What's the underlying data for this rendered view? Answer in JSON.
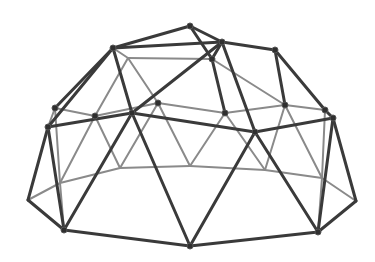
{
  "image": {
    "subject": "geodesic dome climber",
    "background": "#ffffff",
    "strut_color_front": "#3a3a3a",
    "strut_color_back": "#8a8a8a",
    "hub_color": "#2f2f2f"
  },
  "nodes": {
    "T0": [
      190,
      26
    ],
    "TL": [
      113,
      48
    ],
    "TR": [
      222,
      42
    ],
    "TR2": [
      275,
      50
    ],
    "TM": [
      212,
      59
    ],
    "TL2": [
      128,
      58
    ],
    "ML": [
      55,
      108
    ],
    "ML2": [
      48,
      127
    ],
    "M1": [
      95,
      116
    ],
    "M2": [
      132,
      113
    ],
    "M3": [
      158,
      103
    ],
    "M4": [
      225,
      113
    ],
    "M5": [
      255,
      132
    ],
    "M6": [
      285,
      105
    ],
    "MR": [
      325,
      110
    ],
    "MR2": [
      333,
      118
    ],
    "LB1": [
      120,
      168
    ],
    "LB2": [
      190,
      166
    ],
    "LB3": [
      265,
      170
    ],
    "LBL": [
      60,
      183
    ],
    "LBR": [
      322,
      178
    ],
    "BL": [
      28,
      200
    ],
    "BL2": [
      64,
      230
    ],
    "BC": [
      190,
      246
    ],
    "BR": [
      318,
      232
    ],
    "BRR": [
      356,
      201
    ]
  },
  "front_struts": [
    [
      "T0",
      "TL"
    ],
    [
      "T0",
      "TR"
    ],
    [
      "TL",
      "TR"
    ],
    [
      "TR",
      "TR2"
    ],
    [
      "TL",
      "ML"
    ],
    [
      "TL",
      "ML2"
    ],
    [
      "TR",
      "M2"
    ],
    [
      "TR",
      "TM"
    ],
    [
      "TM",
      "M4"
    ],
    [
      "TR2",
      "MR"
    ],
    [
      "TR2",
      "M6"
    ],
    [
      "TL",
      "M2"
    ],
    [
      "ML2",
      "M2"
    ],
    [
      "M2",
      "M5"
    ],
    [
      "M5",
      "MR2"
    ],
    [
      "MR",
      "MR2"
    ],
    [
      "ML2",
      "BL"
    ],
    [
      "ML2",
      "BL2"
    ],
    [
      "M2",
      "BL2"
    ],
    [
      "M2",
      "BC"
    ],
    [
      "M5",
      "BC"
    ],
    [
      "M5",
      "BR"
    ],
    [
      "MR2",
      "BR"
    ],
    [
      "MR2",
      "BRR"
    ],
    [
      "BL",
      "BL2"
    ],
    [
      "BL2",
      "BC"
    ],
    [
      "BC",
      "BR"
    ],
    [
      "BR",
      "BRR"
    ],
    [
      "TM",
      "T0"
    ],
    [
      "TR",
      "M5"
    ]
  ],
  "back_struts": [
    [
      "TL2",
      "TM"
    ],
    [
      "TL2",
      "M1"
    ],
    [
      "TL2",
      "M3"
    ],
    [
      "TM",
      "M6"
    ],
    [
      "M1",
      "M3"
    ],
    [
      "M3",
      "M4"
    ],
    [
      "M4",
      "M6"
    ],
    [
      "M6",
      "MR"
    ],
    [
      "ML",
      "M1"
    ],
    [
      "ML",
      "ML2"
    ],
    [
      "M1",
      "LB1"
    ],
    [
      "M3",
      "LB1"
    ],
    [
      "M3",
      "LB2"
    ],
    [
      "M4",
      "LB2"
    ],
    [
      "M4",
      "LB3"
    ],
    [
      "M6",
      "LB3"
    ],
    [
      "MR",
      "LBR"
    ],
    [
      "M6",
      "LBR"
    ],
    [
      "ML",
      "LBL"
    ],
    [
      "M1",
      "LBL"
    ],
    [
      "LBL",
      "LB1"
    ],
    [
      "LB1",
      "LB2"
    ],
    [
      "LB2",
      "LB3"
    ],
    [
      "LB3",
      "LBR"
    ],
    [
      "BL",
      "LBL"
    ],
    [
      "BL2",
      "LBL"
    ],
    [
      "BR",
      "LBR"
    ],
    [
      "BRR",
      "LBR"
    ],
    [
      "TL",
      "TL2"
    ]
  ],
  "hubs": [
    "T0",
    "TL",
    "TR",
    "TR2",
    "TM",
    "ML",
    "ML2",
    "M1",
    "M2",
    "M3",
    "M4",
    "M5",
    "M6",
    "MR",
    "MR2",
    "BL2",
    "BC",
    "BR"
  ]
}
